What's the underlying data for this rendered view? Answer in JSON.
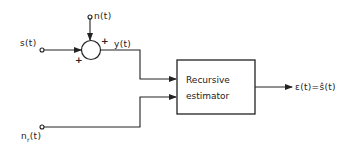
{
  "diagram": {
    "type": "block-diagram",
    "inputs": {
      "signal": "s(t)",
      "noise": "n(t)",
      "reference_noise": "n",
      "reference_noise_sub": "r",
      "reference_noise_suffix": "(t)"
    },
    "summing_junction": {
      "sign_top": "+",
      "sign_left": "+"
    },
    "intermediate": "y(t)",
    "block": {
      "line1": "Recursive",
      "line2": "estimator"
    },
    "output": "ε(t)=ŝ(t)"
  }
}
